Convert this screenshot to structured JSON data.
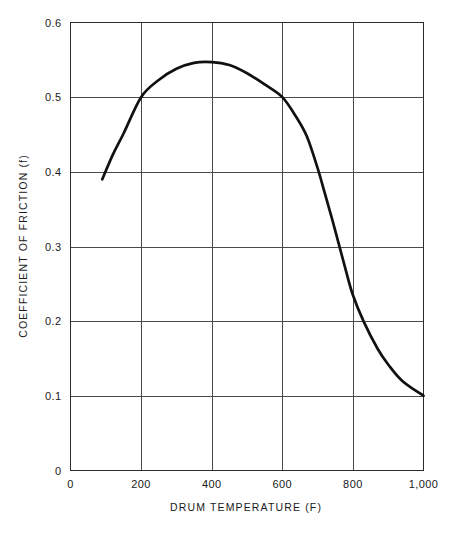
{
  "chart_data": {
    "type": "line",
    "title": "",
    "subtitle": "",
    "xlabel": "DRUM TEMPERATURE (F)",
    "ylabel": "COEFFICIENT OF FRICTION (f)",
    "xlim": [
      0,
      1000
    ],
    "ylim": [
      0,
      0.6
    ],
    "grid": true,
    "legend": "none",
    "x_ticks": [
      0,
      200,
      400,
      600,
      800,
      1000
    ],
    "x_tick_labels": [
      "0",
      "200",
      "400",
      "600",
      "800",
      "1,000"
    ],
    "y_ticks": [
      0,
      0.1,
      0.2,
      0.3,
      0.4,
      0.5,
      0.6
    ],
    "y_tick_labels": [
      "0",
      "0.1",
      "0.2",
      "0.3",
      "0.4",
      "0.5",
      "0.6"
    ],
    "series": [
      {
        "name": "coefficient of friction",
        "color": "#111111",
        "x": [
          90,
          120,
          150,
          200,
          250,
          300,
          350,
          400,
          450,
          500,
          550,
          600,
          640,
          670,
          700,
          720,
          745,
          780,
          800,
          830,
          870,
          900,
          940,
          1000
        ],
        "y": [
          0.39,
          0.423,
          0.451,
          0.5,
          0.523,
          0.538,
          0.546,
          0.547,
          0.543,
          0.532,
          0.517,
          0.5,
          0.473,
          0.447,
          0.405,
          0.372,
          0.33,
          0.268,
          0.235,
          0.2,
          0.163,
          0.142,
          0.12,
          0.1
        ]
      }
    ],
    "annotations": []
  },
  "axes": {
    "x_title": "DRUM TEMPERATURE (F)",
    "y_title": "COEFFICIENT OF FRICTION (f)"
  },
  "ticks": {
    "x": [
      "0",
      "200",
      "400",
      "600",
      "800",
      "1,000"
    ],
    "y": [
      "0.6",
      "0.5",
      "0.4",
      "0.3",
      "0.2",
      "0.1",
      "0"
    ]
  },
  "colors": {
    "curve": "#111111",
    "grid": "#4a4a4a",
    "frame": "#2b2b2b",
    "background": "#ffffff"
  }
}
